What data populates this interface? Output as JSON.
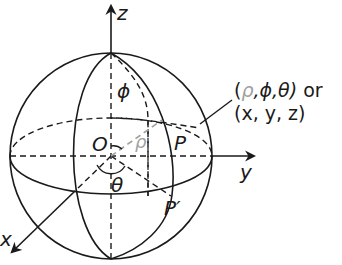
{
  "figure": {
    "axes": {
      "z_label": "z",
      "y_label": "y",
      "x_label": "x"
    },
    "points": {
      "origin_label": "O",
      "point_label": "P",
      "projection_label": "P′"
    },
    "angles": {
      "phi_label": "ϕ",
      "theta_label": "θ",
      "rho_label": "ρ"
    },
    "annotation": {
      "line1_open": "(",
      "line1_rho": "ρ",
      "line1_rest": ",ϕ,θ)",
      "line1_or": " or",
      "line2": "(x, y, z)"
    },
    "colors": {
      "stroke": "#1a1a1a",
      "rho": "#a0a0a0",
      "background": "#ffffff"
    }
  }
}
